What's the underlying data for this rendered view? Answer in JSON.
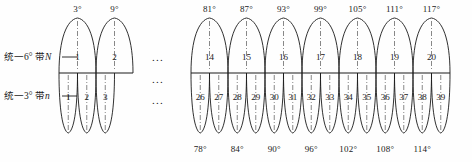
{
  "figure": {
    "colors": {
      "stroke": "#1a1a1a",
      "centerline": "#555555",
      "background": "#fefefe"
    },
    "ellipsis_mark": "...",
    "degree_symbol": "°"
  },
  "labels": {
    "six_degree_row": "统一6° 带",
    "six_degree_symbol": "N",
    "three_degree_row": "统一3° 带",
    "three_degree_symbol": "n"
  },
  "ellipses": [
    {
      "name": "ellipsis-upper",
      "text": "..."
    },
    {
      "name": "ellipsis-middle",
      "text": "..."
    },
    {
      "name": "ellipsis-lower",
      "text": "..."
    }
  ],
  "six_degree_zones": {
    "left_group": [
      {
        "zone": "1",
        "meridian": "3°"
      },
      {
        "zone": "2",
        "meridian": "9°"
      }
    ],
    "right_group": [
      {
        "zone": "14",
        "meridian": "81°"
      },
      {
        "zone": "15",
        "meridian": "87°"
      },
      {
        "zone": "16",
        "meridian": "93°"
      },
      {
        "zone": "17",
        "meridian": "99°"
      },
      {
        "zone": "18",
        "meridian": "105°"
      },
      {
        "zone": "19",
        "meridian": "111°"
      },
      {
        "zone": "20",
        "meridian": "117°"
      }
    ]
  },
  "three_degree_zones": {
    "left_group": [
      {
        "zone": "1"
      },
      {
        "zone": "2"
      },
      {
        "zone": "3"
      }
    ],
    "right_group": [
      {
        "zone": "26"
      },
      {
        "zone": "27"
      },
      {
        "zone": "28"
      },
      {
        "zone": "29"
      },
      {
        "zone": "30"
      },
      {
        "zone": "31"
      },
      {
        "zone": "32"
      },
      {
        "zone": "33"
      },
      {
        "zone": "34"
      },
      {
        "zone": "35"
      },
      {
        "zone": "36"
      },
      {
        "zone": "37"
      },
      {
        "zone": "38"
      },
      {
        "zone": "39"
      }
    ],
    "bottom_meridians": [
      {
        "value": "78°"
      },
      {
        "value": "84°"
      },
      {
        "value": "90°"
      },
      {
        "value": "96°"
      },
      {
        "value": "102°"
      },
      {
        "value": "108°"
      },
      {
        "value": "114°"
      }
    ]
  }
}
